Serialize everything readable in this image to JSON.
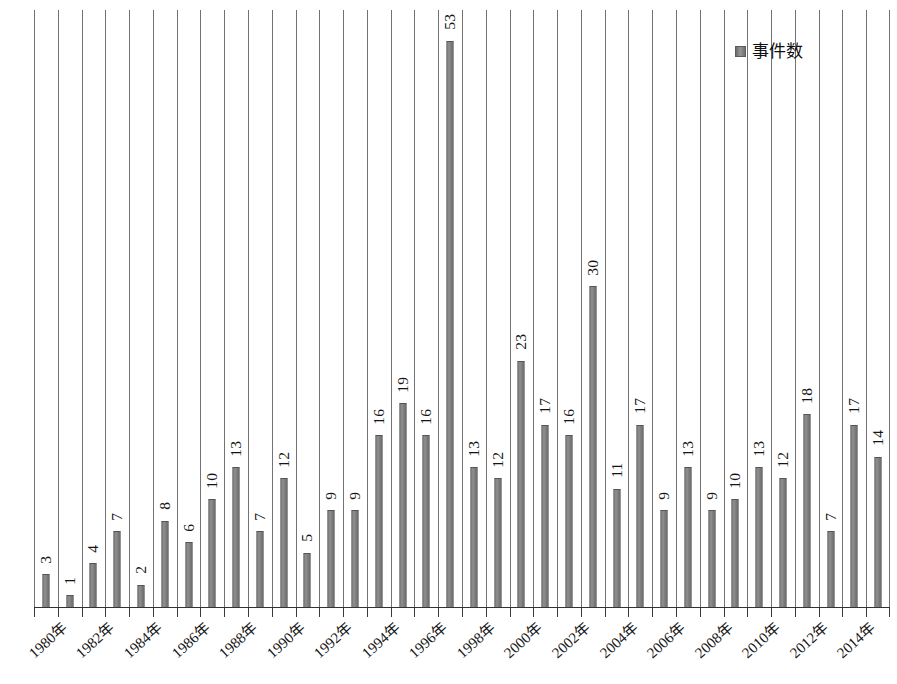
{
  "legend": {
    "label": "事件数",
    "swatch_color": "#7a7a7a",
    "position": "top-right"
  },
  "axis": {
    "tick_label_suffix": "年",
    "tick_label_step_years": 2,
    "baseline_color": "#333333",
    "gridline_color": "#5a5a5a"
  },
  "chart_data": {
    "type": "bar",
    "title": "",
    "subtitle": "",
    "xlabel": "",
    "ylabel": "",
    "grid": true,
    "grid_orientation": "vertical",
    "legend_position": "top-right",
    "bar_color": "#7d7d7d",
    "ylim": [
      0,
      56
    ],
    "show_value_labels": true,
    "value_label_rotation": -90,
    "tick_label_rotation": -42,
    "categories": [
      "1980年",
      "1981年",
      "1982年",
      "1983年",
      "1984年",
      "1985年",
      "1986年",
      "1987年",
      "1988年",
      "1989年",
      "1990年",
      "1991年",
      "1992年",
      "1993年",
      "1994年",
      "1995年",
      "1996年",
      "1997年",
      "1998年",
      "1999年",
      "2000年",
      "2001年",
      "2002年",
      "2003年",
      "2004年",
      "2005年",
      "2006年",
      "2007年",
      "2008年",
      "2009年",
      "2010年",
      "2011年",
      "2012年",
      "2013年",
      "2014年",
      "2015年"
    ],
    "visible_tick_labels": [
      "1980年",
      "1982年",
      "1984年",
      "1986年",
      "1988年",
      "1990年",
      "1992年",
      "1994年",
      "1996年",
      "1998年",
      "2000年",
      "2002年",
      "2004年",
      "2006年",
      "2008年",
      "2010年",
      "2012年",
      "2014年"
    ],
    "series": [
      {
        "name": "事件数",
        "values": [
          3,
          1,
          4,
          7,
          2,
          8,
          6,
          10,
          13,
          7,
          12,
          5,
          9,
          9,
          16,
          19,
          16,
          53,
          13,
          12,
          23,
          17,
          16,
          30,
          11,
          17,
          9,
          13,
          9,
          10,
          13,
          12,
          18,
          7,
          17,
          14
        ]
      }
    ]
  }
}
